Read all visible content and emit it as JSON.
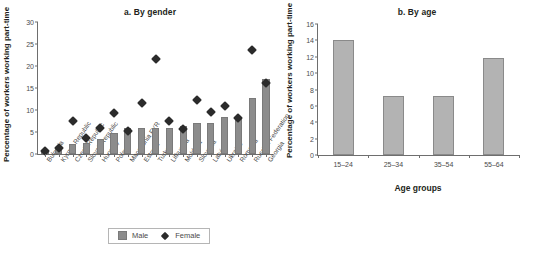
{
  "chart_data": [
    {
      "type": "bar",
      "title": "a. By gender",
      "xlabel": "",
      "ylabel": "Percentage of workers working part-time",
      "ylim": [
        0,
        30
      ],
      "yticks": [
        0,
        5,
        10,
        15,
        20,
        25,
        30
      ],
      "grid": false,
      "legend_position": "bottom",
      "categories": [
        "Bulgaria",
        "Kyrgyz Republic",
        "Czech Republic",
        "Slovak Republic",
        "Hungary",
        "Poland",
        "Macedonia FYR",
        "Estonia",
        "Turkey",
        "Lithuania",
        "Moldova",
        "Slovenia",
        "Latvia",
        "Ukraine",
        "Romania",
        "Russian Federation",
        "Georgia"
      ],
      "series": [
        {
          "name": "Male",
          "marker": "square",
          "color": "#8c8c8c",
          "values": [
            0.5,
            1.2,
            2.2,
            2.5,
            3.5,
            4.8,
            5.9,
            5.9,
            5.9,
            6.0,
            6.4,
            7.1,
            7.0,
            8.5,
            8.0,
            12.8,
            17.0
          ]
        },
        {
          "name": "Female",
          "marker": "diamond",
          "color": "#2b2b2b",
          "values": [
            1.5,
            2.2,
            8.4,
            4.4,
            6.8,
            10.1,
            6.0,
            12.4,
            22.5,
            8.2,
            6.5,
            13.0,
            10.3,
            11.8,
            9.0,
            24.5,
            17.0
          ]
        }
      ]
    },
    {
      "type": "bar",
      "title": "b. By age",
      "xlabel": "Age groups",
      "ylabel": "Percentage of workers working part-time",
      "ylim": [
        0,
        16
      ],
      "yticks": [
        0,
        2,
        4,
        6,
        8,
        10,
        12,
        14,
        16
      ],
      "grid": false,
      "categories": [
        "15–24",
        "25–34",
        "35–54",
        "55–64"
      ],
      "values": [
        14.1,
        7.2,
        7.2,
        11.9
      ],
      "color": "#b3b3b3"
    }
  ],
  "panel_a": {
    "title": "a. By gender",
    "ylabel": "Percentage of workers working part-time",
    "legend": {
      "male_label": "Male",
      "female_label": "Female"
    }
  },
  "panel_b": {
    "title": "b. By age",
    "ylabel": "Percentage of workers working part-time",
    "xlabel": "Age groups"
  }
}
